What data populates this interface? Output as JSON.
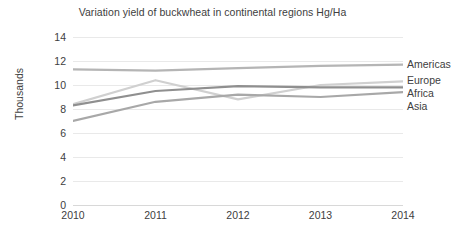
{
  "chart_data": {
    "type": "line",
    "title": "Variation yield of buckwheat in continental regions Hg/Ha",
    "xlabel": "",
    "ylabel": "Thousands",
    "categories": [
      "2010",
      "2011",
      "2012",
      "2013",
      "2014"
    ],
    "x": [
      2010,
      2011,
      2012,
      2013,
      2014
    ],
    "ylim": [
      0,
      14
    ],
    "yticks": [
      "0",
      "2",
      "4",
      "6",
      "8",
      "10",
      "12",
      "14"
    ],
    "ytick_values": [
      0,
      2,
      4,
      6,
      8,
      10,
      12,
      14
    ],
    "grid": true,
    "legend_position": "right-inline",
    "series": [
      {
        "name": "Americas",
        "color": "#b5b5b5",
        "values": [
          11.3,
          11.2,
          11.4,
          11.6,
          11.7
        ]
      },
      {
        "name": "Europe",
        "color": "#d0d0d0",
        "values": [
          8.4,
          10.4,
          8.8,
          10.0,
          10.3
        ]
      },
      {
        "name": "Africa",
        "color": "#8f8f8f",
        "values": [
          8.3,
          9.5,
          9.9,
          9.8,
          9.8
        ]
      },
      {
        "name": "Asia",
        "color": "#a8a8a8",
        "values": [
          7.0,
          8.6,
          9.2,
          9.0,
          9.4
        ]
      }
    ]
  }
}
